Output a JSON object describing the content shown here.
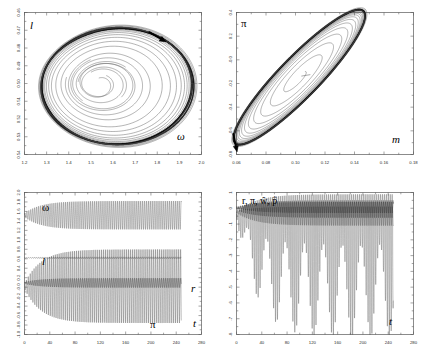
{
  "chart_data": [
    {
      "id": "panel-top-left",
      "type": "line",
      "title": "",
      "subtype": "phase-portrait",
      "xlabel": "ω",
      "ylabel": "l",
      "xlim": [
        1.2,
        2.0
      ],
      "ylim": [
        0.46,
        0.64
      ],
      "xticks": [
        "1.2",
        "1.3",
        "1.4",
        "1.5",
        "1.6",
        "1.7",
        "1.8",
        "1.9",
        "2.0"
      ],
      "yticks": [
        "0.46",
        "0.47",
        "0.48",
        "0.49",
        "0.50",
        "0.51",
        "0.52",
        "0.53",
        "0.64"
      ],
      "ytick_values": [
        "0.46",
        "0.47",
        "0.48",
        "0.49",
        "0.50",
        "0.51",
        "0.52",
        "0.53",
        "0.54"
      ],
      "grid": false,
      "legend": "none",
      "annotations": [
        {
          "name": "direction-arrow",
          "text": "",
          "x": 1.78,
          "y": 0.627,
          "note": "clockwise flow arrow on outer cycle"
        }
      ],
      "series": [
        {
          "name": "transient-spiral",
          "style": "thin",
          "description": "inward spiral growing outward toward limit cycle"
        },
        {
          "name": "limit-cycle",
          "style": "thick",
          "description": "attracting closed orbit, rounded-triangular shape"
        }
      ],
      "center": [
        1.5,
        0.5035
      ],
      "orientation": "counterclockwise-outward"
    },
    {
      "id": "panel-top-right",
      "type": "line",
      "title": "",
      "subtype": "phase-portrait",
      "xlabel": "m",
      "ylabel": "π",
      "xlim": [
        0.06,
        0.18
      ],
      "ylim": [
        -0.8,
        0.4
      ],
      "xticks": [
        "0.06",
        "0.08",
        "0.10",
        "0.12",
        "0.14",
        "0.16",
        "0.18"
      ],
      "yticks": [
        "0.4",
        "0.2",
        "-0.0",
        "-0.2",
        "-0.4",
        "-0.6",
        "-0.8"
      ],
      "grid": false,
      "legend": "none",
      "annotations": [
        {
          "name": "direction-arrow",
          "text": "",
          "x": 0.0745,
          "y": -0.06,
          "note": "upward flow arrow on left branch"
        }
      ],
      "series": [
        {
          "name": "transient-spiral",
          "style": "thin",
          "description": "nested tilted ellipses expanding outward"
        },
        {
          "name": "limit-cycle",
          "style": "thick",
          "description": "outer elongated diagonal closed orbit"
        }
      ],
      "center": [
        0.1035,
        -0.055
      ],
      "orientation": "clockwise-outward"
    },
    {
      "id": "panel-bottom-left",
      "type": "line",
      "title": "",
      "subtype": "time-series",
      "xlabel": "t",
      "ylabel": "",
      "xlim": [
        0,
        280
      ],
      "ylim": [
        -1.0,
        2.0
      ],
      "xticks": [
        "0",
        "40",
        "80",
        "120",
        "160",
        "200",
        "240",
        "280"
      ],
      "yticks": [
        "2.0",
        "1.8",
        "1.6",
        "1.4",
        "1.2",
        "1.0",
        "0.8",
        "0.6",
        "0.4",
        "0.2",
        "-0.0",
        "-0.2",
        "-0.4",
        "-0.6",
        "-0.8",
        "-1.0"
      ],
      "grid": false,
      "legend": "inline-labels",
      "t_end_data": 248,
      "series": [
        {
          "name": "ω",
          "label": "ω",
          "baseline": 1.52,
          "amp_start": 0.04,
          "amp_end": 0.3,
          "label_x": 30,
          "label_y": 1.8
        },
        {
          "name": "l",
          "label": "l",
          "baseline": 0.62,
          "amp_start": 0.004,
          "amp_end": 0.02,
          "label_x": 28,
          "label_y": 0.9
        },
        {
          "name": "r",
          "label": "r",
          "baseline": 0.09,
          "amp_start": 0.02,
          "amp_end": 0.1,
          "label_x": 268,
          "label_y": 0.06
        },
        {
          "name": "π",
          "label": "π",
          "baseline": 0.02,
          "amp_start": 0.05,
          "amp_end": 0.72,
          "label_x": 212,
          "label_y": -0.8
        }
      ]
    },
    {
      "id": "panel-bottom-right",
      "type": "line",
      "title": "",
      "subtype": "time-series",
      "xlabel": "t",
      "ylabel": "",
      "series_label": "r, π, ŵ, p̂",
      "xlim": [
        0,
        280
      ],
      "ylim": [
        -8,
        1
      ],
      "xticks": [
        "0",
        "40",
        "80",
        "120",
        "160",
        "200",
        "240",
        "280"
      ],
      "yticks": [
        "1",
        "0",
        "-1",
        "-2",
        "-3",
        "-4",
        "-5",
        "-6",
        "-7",
        "-8"
      ],
      "grid": false,
      "legend": "inline-label",
      "t_end_data": 248,
      "series": [
        {
          "name": "r",
          "label": "r",
          "baseline": 0.05,
          "amp_start": 0.05,
          "amp_end": 0.35
        },
        {
          "name": "π",
          "label": "π",
          "baseline": -0.05,
          "amp_start": 0.08,
          "amp_end": 0.55
        },
        {
          "name": "w-hat",
          "label": "ŵ",
          "baseline": -0.2,
          "amp_start": 0.1,
          "amp_end": 1.0
        },
        {
          "name": "p-hat",
          "label": "p̂",
          "baseline": -0.3,
          "amp_start": 0.2,
          "amp_end": 6.6,
          "note": "large downward spikes"
        }
      ]
    }
  ]
}
